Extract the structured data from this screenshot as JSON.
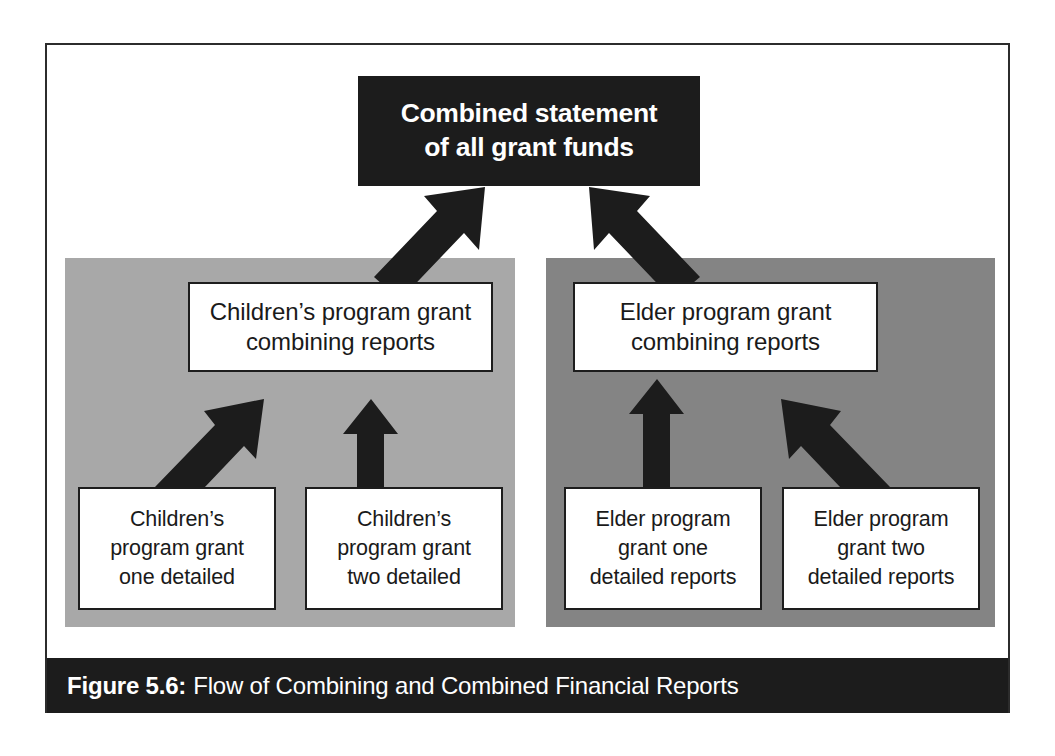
{
  "figure": {
    "caption_label": "Figure 5.6:",
    "caption_text": "Flow of Combining and Combined Financial Reports",
    "colors": {
      "frame_border": "#2c2c2c",
      "dark_fill": "#1c1c1c",
      "panel_left": "#a8a8a8",
      "panel_right": "#848484",
      "box_fill": "#ffffff",
      "box_border": "#1d1d1d",
      "arrow_fill": "#1c1c1c",
      "dark_text": "#1a1a1a",
      "light_text": "#ffffff"
    }
  },
  "nodes": {
    "top": {
      "line1": "Combined statement",
      "line2": "of all grant funds"
    },
    "middle": [
      {
        "id": "children-combining",
        "line1": "Children’s program grant",
        "line2": "combining reports"
      },
      {
        "id": "elder-combining",
        "line1": "Elder program grant",
        "line2": "combining reports"
      }
    ],
    "leaves": [
      {
        "id": "children-grant-one",
        "line1": "Children’s",
        "line2": "program grant",
        "line3": "one detailed"
      },
      {
        "id": "children-grant-two",
        "line1": "Children’s",
        "line2": "program grant",
        "line3": "two detailed"
      },
      {
        "id": "elder-grant-one",
        "line1": "Elder program",
        "line2": "grant one",
        "line3": "detailed reports"
      },
      {
        "id": "elder-grant-two",
        "line1": "Elder program",
        "line2": "grant two",
        "line3": "detailed reports"
      }
    ]
  },
  "groups": [
    {
      "id": "children-program-group",
      "shade": "light"
    },
    {
      "id": "elder-program-group",
      "shade": "dark"
    }
  ],
  "arrows": [
    {
      "id": "children-combining-to-combined",
      "from": "children-combining",
      "to": "combined-statement",
      "direction": "diagonal-up-right"
    },
    {
      "id": "elder-combining-to-combined",
      "from": "elder-combining",
      "to": "combined-statement",
      "direction": "diagonal-up-left"
    },
    {
      "id": "children-one-to-combining",
      "from": "children-grant-one",
      "to": "children-combining",
      "direction": "diagonal-up-right"
    },
    {
      "id": "children-two-to-combining",
      "from": "children-grant-two",
      "to": "children-combining",
      "direction": "vertical-up"
    },
    {
      "id": "elder-one-to-combining",
      "from": "elder-grant-one",
      "to": "elder-combining",
      "direction": "vertical-up"
    },
    {
      "id": "elder-two-to-combining",
      "from": "elder-grant-two",
      "to": "elder-combining",
      "direction": "diagonal-up-left"
    }
  ]
}
